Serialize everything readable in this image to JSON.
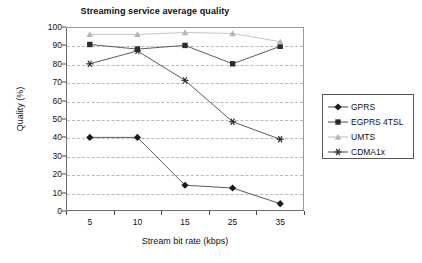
{
  "chart_data": {
    "type": "line",
    "title": "Streaming service average quality",
    "xlabel": "Stream bit rate (kbps)",
    "ylabel": "Quality (%)",
    "categories": [
      "5",
      "10",
      "15",
      "25",
      "35"
    ],
    "ylim": [
      0,
      100
    ],
    "ytick_step": 10,
    "yticks": [
      "0",
      "10",
      "20",
      "30",
      "40",
      "50",
      "60",
      "70",
      "80",
      "90",
      "100"
    ],
    "grid": "horizontal-dashed",
    "legend_position": "right",
    "series": [
      {
        "name": "GPRS",
        "marker": "diamond",
        "color": "#1a1a1a",
        "line_color": "#4a4a4a",
        "values": [
          40,
          40,
          14,
          12.5,
          4
        ]
      },
      {
        "name": "EGPRS 4TSL",
        "marker": "square",
        "color": "#2b2b2b",
        "line_color": "#4a4a4a",
        "values": [
          90.5,
          88,
          90,
          80,
          89.5
        ]
      },
      {
        "name": "UMTS",
        "marker": "triangle",
        "color": "#b5b5b5",
        "line_color": "#bcbcbc",
        "values": [
          96,
          96,
          97,
          96.5,
          92
        ]
      },
      {
        "name": "CDMA1x",
        "marker": "asterisk",
        "color": "#2b2b2b",
        "line_color": "#4a4a4a",
        "values": [
          80,
          87,
          71,
          48.5,
          39
        ]
      }
    ]
  },
  "colors": {
    "axis": "#4a4a4a",
    "grid": "#b9b9b9",
    "frame": "#6e6e6e",
    "background": "#ffffff",
    "text": "#111111"
  }
}
